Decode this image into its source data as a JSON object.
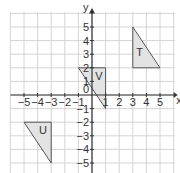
{
  "diagram": {
    "type": "coordinate-grid",
    "axes": {
      "x_label": "x",
      "y_label": "y",
      "origin_label": "0"
    },
    "x_ticks": [
      "-5",
      "-4",
      "-3",
      "-2",
      "-1",
      "1",
      "2",
      "3",
      "4",
      "5"
    ],
    "y_ticks": [
      "5",
      "4",
      "3",
      "2",
      "1",
      "-1",
      "-2",
      "-3",
      "-4",
      "-5"
    ],
    "shapes": [
      {
        "label": "T",
        "vertices": [
          [
            3,
            5
          ],
          [
            3,
            2
          ],
          [
            5,
            2
          ]
        ]
      },
      {
        "label": "V",
        "vertices": [
          [
            -1,
            2
          ],
          [
            1,
            2
          ],
          [
            1,
            -1
          ]
        ]
      },
      {
        "label": "U",
        "vertices": [
          [
            -5,
            -2
          ],
          [
            -3,
            -2
          ],
          [
            -3,
            -5
          ]
        ]
      }
    ],
    "colors": {
      "fill": "#e3e3e3",
      "stroke": "#555555",
      "grid": "#d4d4d4"
    }
  }
}
